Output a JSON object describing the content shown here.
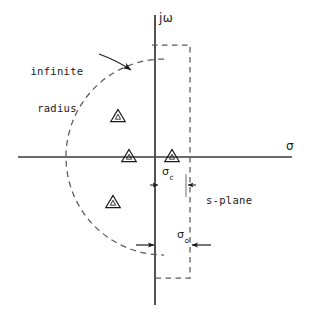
{
  "figure": {
    "type": "diagram",
    "width": 309,
    "height": 319,
    "background_color": "#ffffff",
    "line_color": "#3a3a3a",
    "text_color": "#1a1a1a"
  },
  "labels": {
    "infinite_radius_line1": "infinite",
    "infinite_radius_line2": "radius",
    "s_plane": "s-plane",
    "j_omega_axis": "jω",
    "sigma_axis": "σ",
    "sigma_c_symbol": "σ",
    "sigma_c_subscript": "c",
    "sigma_o_symbol": "σ",
    "sigma_o_subscript": "o"
  },
  "axes": {
    "real_axis_label": "σ",
    "imaginary_axis_label": "jω",
    "origin_x": 155,
    "origin_y": 157,
    "real_axis_x_start": 18,
    "real_axis_x_end": 292,
    "imag_axis_y_start": 15,
    "imag_axis_y_end": 305
  },
  "contour": {
    "arc_style": "dashed",
    "arc_description": "semicircular arc of infinite radius in left half plane",
    "arc_center_x": 155,
    "arc_center_y": 157,
    "arc_radius": 98,
    "vertical_dashed_line_x": 190,
    "vertical_dashed_line_y_top": 45,
    "vertical_dashed_line_y_bottom": 278,
    "dash_pattern": "5 4"
  },
  "poles": [
    {
      "name": "pole-upper-left",
      "x": 118,
      "y": 117,
      "marker": "triangle"
    },
    {
      "name": "pole-axis-left",
      "x": 129,
      "y": 157,
      "marker": "triangle"
    },
    {
      "name": "pole-axis-right",
      "x": 172,
      "y": 157,
      "marker": "triangle"
    },
    {
      "name": "pole-lower-left",
      "x": 113,
      "y": 203,
      "marker": "triangle"
    }
  ],
  "dimensions": [
    {
      "name": "sigma-c",
      "label_symbol": "σ",
      "label_subscript": "c",
      "from_x": 155,
      "to_x": 190,
      "y": 185,
      "arrow_style": "inward-arrows"
    },
    {
      "name": "sigma-o",
      "label_symbol": "σ",
      "label_subscript": "o",
      "from_x": 155,
      "to_x": 190,
      "y": 245,
      "arrow_style": "inward-arrows"
    }
  ],
  "annotation": {
    "leader_from_x": 100,
    "leader_from_y": 57,
    "leader_to_x": 133,
    "leader_to_y": 70,
    "target": "infinite radius arc"
  }
}
